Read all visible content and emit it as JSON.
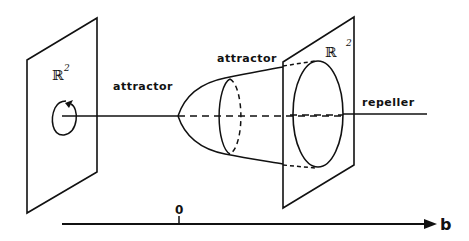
{
  "figure": {
    "left_plane": {
      "space_label": "ℝ",
      "space_exponent": "2",
      "rotation_icon": "clockwise-rotation-arrow"
    },
    "right_plane": {
      "space_label": "ℝ",
      "space_exponent": "2"
    },
    "labels": {
      "attractor_left": "attractor",
      "attractor_top": "attractor",
      "repeller": "repeller"
    },
    "parameter_axis": {
      "zero_label": "0",
      "axis_label": "b"
    },
    "colors": {
      "stroke": "#111111",
      "background": "#ffffff"
    }
  }
}
